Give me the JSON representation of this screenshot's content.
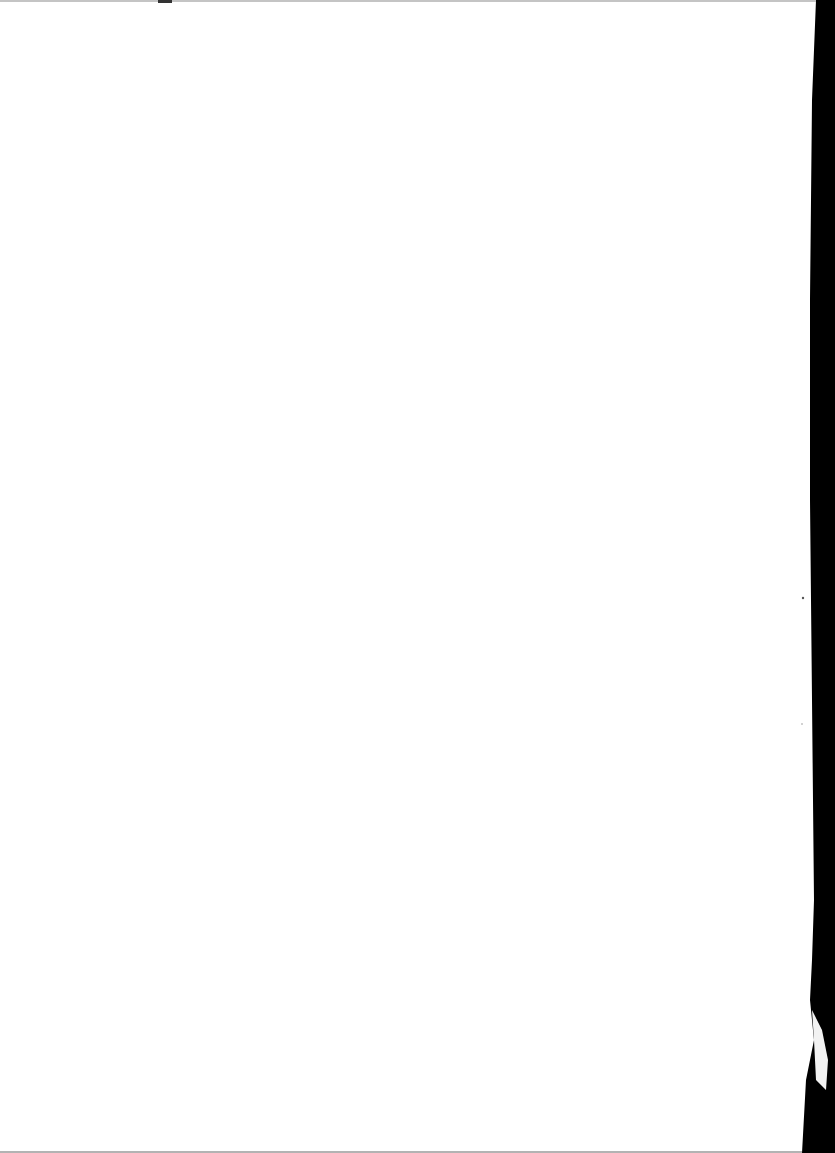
{
  "document": {
    "type": "scanned-page",
    "content": "",
    "colors": {
      "paper": "#ffffff",
      "scanner_background": "#000000",
      "top_edge": "#9a9a9a",
      "bottom_edge": "#8a8a8a"
    }
  }
}
